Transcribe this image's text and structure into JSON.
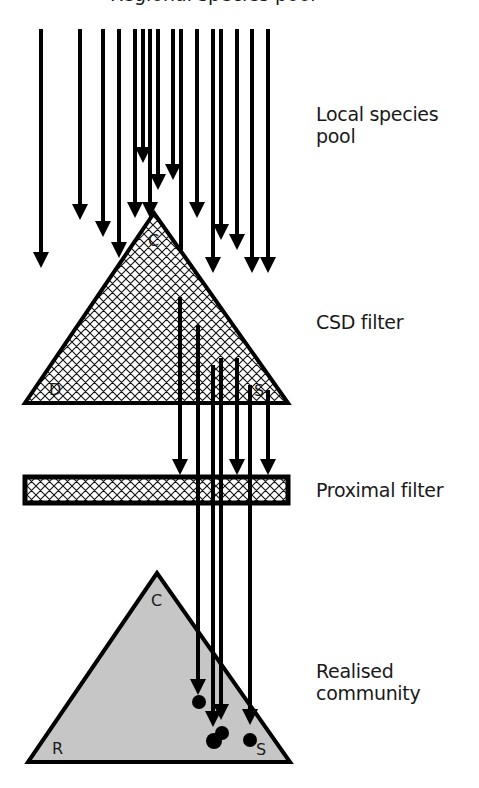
{
  "title_partial": "Regional species pool",
  "labels": {
    "local_pool": [
      "Local species",
      "pool"
    ],
    "csd_filter": "CSD filter",
    "proximal_filter": "Proximal filter",
    "realised": [
      "Realised",
      "community"
    ]
  },
  "csd_triangle": {
    "apex": [
      154,
      213
    ],
    "left": [
      25,
      403
    ],
    "right": [
      288,
      403
    ],
    "corners": {
      "top": "C",
      "left": "D",
      "right": "S"
    },
    "fill": "crosshatch"
  },
  "proximal_bar": {
    "x": 25,
    "y": 477,
    "w": 263,
    "h": 26,
    "fill": "crosshatch"
  },
  "realised_triangle": {
    "apex": [
      157,
      573
    ],
    "left": [
      28,
      762
    ],
    "right": [
      290,
      762
    ],
    "corners": {
      "top": "C",
      "left": "R",
      "right": "S"
    },
    "fill": "#c6c6c6"
  },
  "colors": {
    "ink": "#000000",
    "gray_fill": "#c6c6c6",
    "text": "#1a1a1a"
  },
  "pool_arrows": [
    {
      "x": 41,
      "y1": 29,
      "y2": 268,
      "head": true
    },
    {
      "x": 80,
      "y1": 29,
      "y2": 220,
      "head": true
    },
    {
      "x": 103,
      "y1": 29,
      "y2": 237,
      "head": true
    },
    {
      "x": 119,
      "y1": 29,
      "y2": 258,
      "head": true
    },
    {
      "x": 135,
      "y1": 29,
      "y2": 218,
      "head": true
    },
    {
      "x": 143,
      "y1": 29,
      "y2": 163,
      "head": true
    },
    {
      "x": 150,
      "y1": 29,
      "y2": 218,
      "head": true
    },
    {
      "x": 158,
      "y1": 29,
      "y2": 190,
      "head": true
    },
    {
      "x": 173,
      "y1": 29,
      "y2": 180,
      "head": true
    },
    {
      "x": 181,
      "y1": 29,
      "y2": 250,
      "head": false
    },
    {
      "x": 197,
      "y1": 29,
      "y2": 218,
      "head": true
    },
    {
      "x": 213,
      "y1": 29,
      "y2": 273,
      "head": true
    },
    {
      "x": 221,
      "y1": 29,
      "y2": 240,
      "head": true
    },
    {
      "x": 237,
      "y1": 29,
      "y2": 250,
      "head": true
    },
    {
      "x": 252,
      "y1": 29,
      "y2": 273,
      "head": true
    },
    {
      "x": 268,
      "y1": 29,
      "y2": 273,
      "head": true
    }
  ],
  "csd_arrows": [
    {
      "x": 180,
      "y1": 297,
      "y2": 475,
      "head": true
    },
    {
      "x": 237,
      "y1": 358,
      "y2": 475,
      "head": true
    },
    {
      "x": 268,
      "y1": 390,
      "y2": 475,
      "head": true
    }
  ],
  "survivor_arrows": [
    {
      "x": 198,
      "y1": 325,
      "y2": 695,
      "dot": [
        199,
        702,
        7
      ]
    },
    {
      "x": 213,
      "y1": 365,
      "y2": 727,
      "dot": [
        214,
        741,
        8
      ]
    },
    {
      "x": 221,
      "y1": 358,
      "y2": 720,
      "dot": [
        222,
        733,
        7
      ]
    },
    {
      "x": 250,
      "y1": 385,
      "y2": 725,
      "dot": [
        250,
        740,
        7
      ]
    }
  ]
}
